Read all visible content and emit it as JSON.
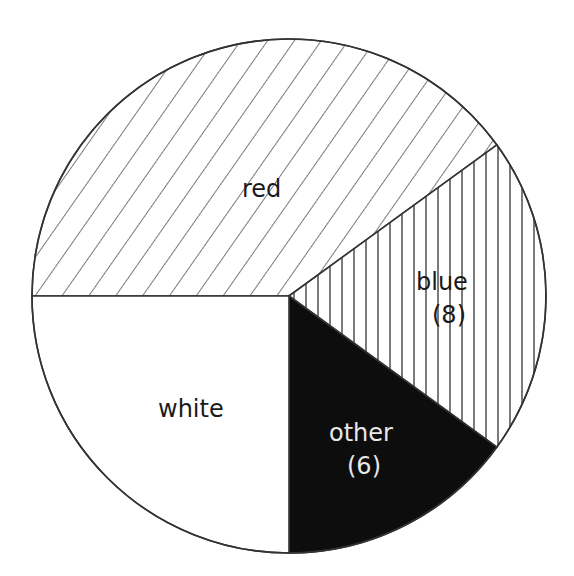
{
  "chart_data": {
    "type": "pie",
    "title": "",
    "categories": [
      "red",
      "blue",
      "other",
      "white"
    ],
    "values": [
      16,
      8,
      6,
      10
    ],
    "labels": [
      "red",
      "blue\n(8)",
      "other\n(6)",
      "white"
    ],
    "patterns": {
      "red": "diagonal-hatch",
      "blue": "vertical-hatch",
      "other": "solid-black",
      "white": "solid-white"
    },
    "colors": {
      "stroke": "#333333",
      "fill_dark": "#0d0d0d",
      "fill_light": "#ffffff"
    },
    "legend": "none",
    "start_angle_deg": 180,
    "direction": "clockwise"
  },
  "slices": {
    "red": {
      "label": "red"
    },
    "blue": {
      "label": "blue",
      "count": "(8)"
    },
    "other": {
      "label": "other",
      "count": "(6)"
    },
    "white": {
      "label": "white"
    }
  }
}
